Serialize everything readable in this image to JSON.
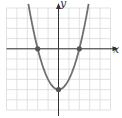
{
  "chart_data": {
    "type": "line",
    "title": "",
    "xlabel": "x",
    "ylabel": "y",
    "xlim": [
      -5,
      5
    ],
    "ylim": [
      -6,
      4
    ],
    "grid": true,
    "legend": null,
    "series": [
      {
        "name": "y = x^2 - 4",
        "x": [
          -2.9,
          -2.5,
          -2,
          -1.5,
          -1,
          -0.5,
          0,
          0.5,
          1,
          1.5,
          2,
          2.5,
          2.9
        ],
        "values": [
          4.41,
          2.25,
          0,
          -1.75,
          -3,
          -3.75,
          -4,
          -3.75,
          -3,
          -1.75,
          0,
          2.25,
          4.41
        ]
      }
    ],
    "marked_points": [
      {
        "x": -2,
        "y": 0
      },
      {
        "x": 2,
        "y": 0
      },
      {
        "x": 0,
        "y": -4
      }
    ]
  },
  "labels": {
    "x_axis": "x",
    "y_axis": "y"
  },
  "colors": {
    "grid": "#d9d9d9",
    "axis": "#333333",
    "curve": "#707070",
    "point": "#555555"
  }
}
